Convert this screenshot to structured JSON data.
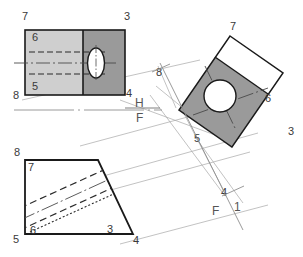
{
  "drawing": {
    "title": "Orthographic projection – auxiliary view of inclined face with hole",
    "background_color": "#ffffff",
    "colors": {
      "outline": "#1a1a1a",
      "light_fill": "#cfcfcf",
      "dark_fill": "#9a9a9a",
      "white_fill": "#ffffff",
      "projection_line": "#9a9a9a",
      "center_line": "#4a4a4a",
      "hidden_line": "#2b2b2b",
      "label_text": "#3a3a3a",
      "reference_text": "#555555"
    },
    "views": [
      {
        "id": "top-view",
        "name": "top-view",
        "description": "Rectangular top view, split into light-gray left half and dark-gray right half, with an ellipse (hole) on the right half",
        "vertex_labels": [
          {
            "text": "7",
            "x": 22,
            "y": 20
          },
          {
            "text": "3",
            "x": 124,
            "y": 20
          },
          {
            "text": "6",
            "x": 32,
            "y": 36
          },
          {
            "text": "5",
            "x": 32,
            "y": 86
          },
          {
            "text": "8",
            "x": 15,
            "y": 96
          },
          {
            "text": "4",
            "x": 125,
            "y": 94
          }
        ]
      },
      {
        "id": "auxiliary-view",
        "name": "auxiliary-view",
        "description": "Rotated auxiliary view: tilted rectangle with white band at top and dark-gray body, containing a true-shape circular hole",
        "vertex_labels": [
          {
            "text": "7",
            "x": 233,
            "y": 31
          },
          {
            "text": "8",
            "x": 159,
            "y": 73
          },
          {
            "text": "6",
            "x": 265,
            "y": 98
          },
          {
            "text": "5",
            "x": 196,
            "y": 140
          },
          {
            "text": "3",
            "x": 289,
            "y": 132
          },
          {
            "text": "4",
            "x": 223,
            "y": 192
          }
        ]
      },
      {
        "id": "front-view",
        "name": "front-view",
        "description": "Trapezoidal front view with inclined right face and hidden (dashed) lines of the hole",
        "vertex_labels": [
          {
            "text": "8",
            "x": 16,
            "y": 152
          },
          {
            "text": "7",
            "x": 29,
            "y": 166
          },
          {
            "text": "5",
            "x": 16,
            "y": 238
          },
          {
            "text": "6",
            "x": 31,
            "y": 229
          },
          {
            "text": "3",
            "x": 109,
            "y": 230
          },
          {
            "text": "4",
            "x": 132,
            "y": 240
          }
        ]
      }
    ],
    "reference_lines": [
      {
        "id": "hf-line",
        "name": "h-f-reference-line",
        "upper_label": "H",
        "lower_label": "F",
        "upper_label_x": 138,
        "upper_label_y": 103,
        "lower_label_x": 139,
        "lower_label_y": 118,
        "orientation": "horizontal"
      },
      {
        "id": "f1-line",
        "name": "f-1-reference-line",
        "upper_label": "F",
        "lower_label": "1",
        "upper_label_x": 216,
        "upper_label_y": 211,
        "lower_label_x": 235,
        "lower_label_y": 207,
        "orientation": "inclined"
      }
    ]
  }
}
